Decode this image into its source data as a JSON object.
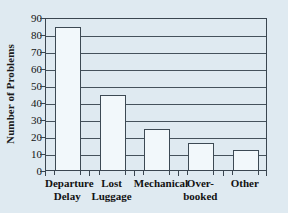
{
  "chart_data": {
    "type": "bar",
    "title": "",
    "subtitle": "",
    "xlabel": "",
    "ylabel": "Number of Problems",
    "categories": [
      "Departure Delay",
      "Lost Luggage",
      "Mechanical",
      "Over-booked",
      "Other"
    ],
    "category_lines": [
      [
        "Departure",
        "Delay"
      ],
      [
        "Lost",
        "Luggage"
      ],
      [
        "Mechanical",
        ""
      ],
      [
        "Over-",
        "booked"
      ],
      [
        "Other",
        ""
      ]
    ],
    "values": [
      84,
      44,
      24,
      16,
      12
    ],
    "ylim": [
      0,
      90
    ],
    "ytick_step": 10,
    "yticks": [
      0,
      10,
      20,
      30,
      40,
      50,
      60,
      70,
      80,
      90
    ],
    "ytick_labels": [
      "0",
      "10",
      "20",
      "30",
      "40",
      "50",
      "60",
      "70",
      "80",
      "90"
    ],
    "grid": true,
    "grid_axis": "y",
    "legend": false,
    "legend_position": "none",
    "bar_fill_color": "#f2f8fb",
    "bar_edge_color": "#3d4a54",
    "axis_color": "#3a4650",
    "grid_color": "#45525c",
    "background_color": "#dfeaf1",
    "text_color": "#121212"
  }
}
